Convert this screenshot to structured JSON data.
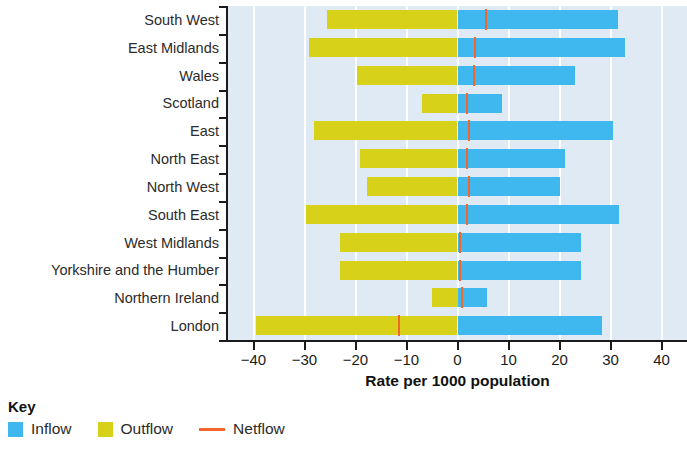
{
  "chart_data": {
    "type": "bar",
    "title": "",
    "subtitle": "",
    "xlabel": "Rate per 1000 population",
    "ylabel": "",
    "xlim": [
      -45,
      45
    ],
    "xticks": [
      -40,
      -30,
      -20,
      -10,
      0,
      10,
      20,
      30,
      40
    ],
    "xtick_labels": [
      "−40",
      "−30",
      "−20",
      "−10",
      "0",
      "10",
      "20",
      "30",
      "40"
    ],
    "grid": "vertical-white",
    "orientation": "horizontal",
    "legend_title": "Key",
    "legend_position": "below-left",
    "categories": [
      "South West",
      "East Midlands",
      "Wales",
      "Scotland",
      "East",
      "North East",
      "North West",
      "South East",
      "West Midlands",
      "Yorkshire and the Humber",
      "Northern Ireland",
      "London"
    ],
    "series": [
      {
        "name": "Inflow",
        "color": "#3fb8ef",
        "values": [
          31.4,
          32.8,
          23.0,
          8.8,
          30.4,
          21.0,
          20.0,
          31.6,
          24.2,
          24.2,
          5.8,
          28.4
        ]
      },
      {
        "name": "Outflow",
        "color": "#d8d119",
        "values": [
          -25.6,
          -29.2,
          -19.8,
          -7.0,
          -28.2,
          -19.2,
          -17.8,
          -29.8,
          -23.0,
          -23.0,
          -5.0,
          -39.6
        ]
      },
      {
        "name": "Netflow",
        "color": "#f1662a",
        "values": [
          5.6,
          3.4,
          3.2,
          1.8,
          2.2,
          1.8,
          2.2,
          1.8,
          0.4,
          0.4,
          0.8,
          -11.4
        ]
      }
    ]
  },
  "legend": {
    "title": "Key",
    "items": [
      {
        "label": "Inflow",
        "marker": "square-blue"
      },
      {
        "label": "Outflow",
        "marker": "square-yellow"
      },
      {
        "label": "Netflow",
        "marker": "line-orange"
      }
    ]
  },
  "axis": {
    "x_title": "Rate per 1000 population"
  },
  "colors": {
    "inflow": "#3fb8ef",
    "outflow": "#d8d119",
    "netflow": "#f1662a",
    "plot_background": "#dfeaf4",
    "gridline": "#ffffff",
    "axis": "#1b1b1b"
  }
}
